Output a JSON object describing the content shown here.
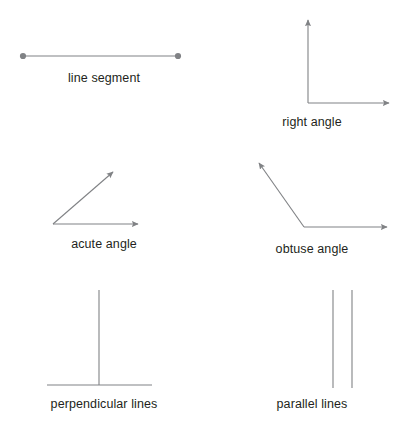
{
  "figure": {
    "title_visible": false,
    "background_color": "#ffffff",
    "stroke_color": "#808285",
    "label_color": "#231f20",
    "endpoint_dot_color": "#808285"
  },
  "items": [
    {
      "id": "line-segment",
      "label": "line segment",
      "type": "segment-with-endpoints",
      "geometry": {
        "x1": 23,
        "y1": 56,
        "x2": 178,
        "y2": 56
      }
    },
    {
      "id": "right-angle",
      "label": "right angle",
      "type": "two-rays-arrowheads",
      "geometry": {
        "vertex_x": 308,
        "vertex_y": 103,
        "ray1_x": 308,
        "ray1_y": 16,
        "ray2_x": 394,
        "ray2_y": 103
      }
    },
    {
      "id": "acute-angle",
      "label": "acute angle",
      "type": "two-rays-arrowheads",
      "geometry": {
        "vertex_x": 53,
        "vertex_y": 224,
        "ray1_x": 118,
        "ray1_y": 168,
        "ray2_x": 143,
        "ray2_y": 224
      }
    },
    {
      "id": "obtuse-angle",
      "label": "obtuse angle",
      "type": "two-rays-arrowheads",
      "geometry": {
        "vertex_x": 304,
        "vertex_y": 227,
        "ray1_x": 254,
        "ray1_y": 158,
        "ray2_x": 392,
        "ray2_y": 227
      }
    },
    {
      "id": "perpendicular-lines",
      "label": "perpendicular lines",
      "type": "two-plain-lines",
      "geometry": {
        "v_x": 99,
        "v_y1": 290,
        "v_y2": 385,
        "h_x1": 47,
        "h_x2": 152,
        "h_y": 385
      }
    },
    {
      "id": "parallel-lines",
      "label": "parallel lines",
      "type": "two-plain-lines",
      "geometry": {
        "l1_x": 333,
        "l2_x": 352,
        "y1": 290,
        "y2": 388
      }
    }
  ]
}
